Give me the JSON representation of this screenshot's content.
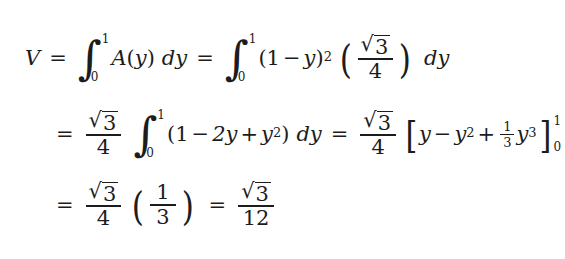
{
  "document": {
    "type": "math-derivation",
    "background_color": "#ffffff",
    "text_color": "#1c1c1c",
    "line_count": 3
  },
  "symbols": {
    "integral": "∫",
    "radical": "√",
    "minus": "−",
    "plus": "+",
    "equals": "=",
    "paren_open": "(",
    "paren_close": ")",
    "bracket_open": "[",
    "bracket_close": "]"
  },
  "line1": {
    "lhs": "V",
    "eq1": "=",
    "int1": {
      "lower": "0",
      "upper": "1",
      "integrand": "A(y)",
      "differential": "dy"
    },
    "integrand_fn": "A",
    "var": "y",
    "eq2": "=",
    "int2": {
      "lower": "0",
      "upper": "1"
    },
    "base": "(1 − y)",
    "exponent": "2",
    "one": "1",
    "minus": "−",
    "coef_fraction": {
      "numerator": "√3",
      "numerator_radicand": "3",
      "denominator": "4"
    },
    "differential": "dy",
    "d": "d"
  },
  "line2": {
    "eq1": "=",
    "coef_fraction": {
      "numerator_radicand": "3",
      "denominator": "4"
    },
    "int": {
      "lower": "0",
      "upper": "1"
    },
    "polynomial": "(1 − 2y + y²)",
    "poly_one": "1",
    "poly_minus": "−",
    "poly_two_y": "2y",
    "poly_plus": "+",
    "poly_y": "y",
    "poly_exp": "2",
    "differential": "dy",
    "d": "d",
    "eq2": "=",
    "coef_fraction2": {
      "numerator_radicand": "3",
      "denominator": "4"
    },
    "antiderivative": "[y − y² + ⅓y³]",
    "anti_y": "y",
    "anti_minus": "−",
    "anti_y2": "y",
    "anti_exp2": "2",
    "anti_plus": "+",
    "anti_third": {
      "numerator": "1",
      "denominator": "3"
    },
    "anti_y3": "y",
    "anti_exp3": "3",
    "eval_lower": "0",
    "eval_upper": "1"
  },
  "line3": {
    "eq1": "=",
    "coef_fraction": {
      "numerator_radicand": "3",
      "denominator": "4"
    },
    "value_fraction": {
      "numerator": "1",
      "denominator": "3"
    },
    "eq2": "=",
    "result_fraction": {
      "numerator_radicand": "3",
      "denominator": "12"
    }
  }
}
